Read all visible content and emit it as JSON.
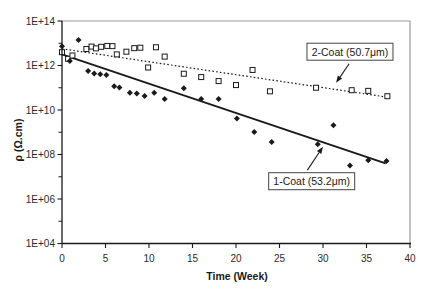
{
  "chart_data": {
    "type": "scatter",
    "title": "",
    "xlabel": "Time (Week)",
    "ylabel": "ρ (Ω.cm)",
    "x_axis": {
      "min": 0,
      "max": 40,
      "ticks": [
        0,
        5,
        10,
        15,
        20,
        25,
        30,
        35,
        40
      ]
    },
    "y_axis": {
      "scale": "log10",
      "min_log10": 4,
      "max_log10": 14,
      "labeled_logs": [
        4,
        6,
        8,
        10,
        12,
        14
      ],
      "tick_labels": [
        "1E+04",
        "1E+06",
        "1E+08",
        "1E+10",
        "1E+12",
        "1E+14"
      ],
      "minor_logs": [
        5,
        7,
        9,
        11,
        13
      ]
    },
    "grid": false,
    "legend": "annotation-boxes-with-arrows",
    "series": [
      {
        "name": "2-Coat (50.7μm)",
        "marker": "open-square",
        "trendline": {
          "style": "dotted",
          "from_week_log10": [
            0,
            12.75
          ],
          "to_week_log10": [
            37.5,
            10.57
          ]
        },
        "points_week_log10": [
          [
            0,
            12.6
          ],
          [
            0.7,
            12.3
          ],
          [
            1.2,
            12.45
          ],
          [
            2.8,
            12.74
          ],
          [
            3.4,
            12.85
          ],
          [
            3.9,
            12.77
          ],
          [
            4.5,
            12.84
          ],
          [
            5.2,
            12.88
          ],
          [
            5.8,
            12.87
          ],
          [
            6.3,
            12.5
          ],
          [
            7.4,
            12.62
          ],
          [
            8.3,
            12.78
          ],
          [
            9.0,
            12.8
          ],
          [
            9.9,
            11.91
          ],
          [
            10.8,
            12.82
          ],
          [
            11.8,
            12.4
          ],
          [
            14.0,
            11.63
          ],
          [
            16.0,
            11.48
          ],
          [
            18.0,
            11.3
          ],
          [
            20.0,
            11.12
          ],
          [
            21.9,
            11.8
          ],
          [
            23.9,
            10.84
          ],
          [
            29.2,
            11.0
          ],
          [
            33.3,
            10.89
          ],
          [
            35.2,
            10.86
          ],
          [
            37.4,
            10.62
          ]
        ]
      },
      {
        "name": "1-Coat (53.2μm)",
        "marker": "filled-diamond",
        "trendline": {
          "style": "solid",
          "from_week_log10": [
            0,
            12.5
          ],
          "to_week_log10": [
            37.2,
            7.6
          ]
        },
        "points_week_log10": [
          [
            0,
            12.87
          ],
          [
            0.9,
            12.2
          ],
          [
            1.9,
            13.15
          ],
          [
            3.0,
            11.75
          ],
          [
            3.7,
            11.64
          ],
          [
            4.4,
            11.61
          ],
          [
            5.1,
            11.57
          ],
          [
            6.0,
            11.07
          ],
          [
            6.6,
            11.01
          ],
          [
            7.8,
            10.77
          ],
          [
            8.6,
            10.74
          ],
          [
            9.5,
            10.63
          ],
          [
            10.6,
            10.77
          ],
          [
            11.8,
            10.5
          ],
          [
            14.0,
            10.98
          ],
          [
            16.0,
            10.49
          ],
          [
            18.0,
            10.49
          ],
          [
            20.1,
            9.62
          ],
          [
            22.1,
            9.01
          ],
          [
            24.1,
            8.56
          ],
          [
            29.4,
            8.46
          ],
          [
            31.2,
            9.31
          ],
          [
            33.1,
            7.51
          ],
          [
            35.2,
            7.74
          ],
          [
            37.3,
            7.71
          ]
        ]
      }
    ],
    "annotations": [
      {
        "label": "2-Coat (50.7μm)",
        "box_center_week_log10": [
          33.1,
          12.62
        ],
        "arrow_from_week_log10": [
          33.0,
          12.08
        ],
        "arrow_to_week_log10": [
          31.5,
          11.22
        ]
      },
      {
        "label": "1-Coat (53.2μm)",
        "box_center_week_log10": [
          28.7,
          6.8
        ],
        "arrow_from_week_log10": [
          28.2,
          7.3
        ],
        "arrow_to_week_log10": [
          30.0,
          8.35
        ]
      }
    ],
    "colors": {
      "ink": "#1a1a1a",
      "frame_gray": "#9a9a9a",
      "annotation_border": "#444444",
      "background": "#ffffff"
    }
  }
}
